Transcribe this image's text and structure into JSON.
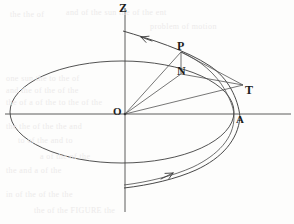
{
  "figure": {
    "background_color": "#fdfdfc",
    "ink_color": "#3a3a3a",
    "label_color": "#1d1d1d",
    "width": 294,
    "height": 224,
    "axes": [
      {
        "name": "z-axis",
        "label": "Z",
        "orientation": "vertical",
        "x": 125,
        "y_top": 8,
        "y_bottom": 212
      },
      {
        "name": "horizontal-axis",
        "label": "",
        "orientation": "horizontal",
        "y": 114,
        "x_left": 5,
        "x_right": 291
      }
    ],
    "labels": [
      {
        "id": "z",
        "text": "Z",
        "x": 119,
        "y": 2
      },
      {
        "id": "p",
        "text": "P",
        "x": 177,
        "y": 40
      },
      {
        "id": "n",
        "text": "N",
        "x": 177,
        "y": 65
      },
      {
        "id": "t",
        "text": "T",
        "x": 245,
        "y": 84
      },
      {
        "id": "a",
        "text": "A",
        "x": 236,
        "y": 114
      },
      {
        "id": "o",
        "text": "O",
        "x": 113,
        "y": 106
      }
    ],
    "points": {
      "O": {
        "x": 125,
        "y": 114
      },
      "P": {
        "x": 181,
        "y": 52
      },
      "N": {
        "x": 181,
        "y": 74
      },
      "T": {
        "x": 243,
        "y": 85
      },
      "A": {
        "x": 240,
        "y": 117
      }
    },
    "ellipse": {
      "name": "orbit-ellipse-projection",
      "center_x": 122,
      "center_y": 112,
      "radius_x": 112,
      "radius_y": 51
    },
    "arrows": [
      {
        "id": "upper-arrow",
        "x": 147,
        "y": 39,
        "direction": "left-up",
        "on": "upper-spiral-curve"
      },
      {
        "id": "lower-arrow",
        "x": 166,
        "y": 177,
        "direction": "right-up",
        "on": "lower-spiral-curve"
      }
    ],
    "segments": [
      {
        "id": "OP",
        "from": "O",
        "to": "P"
      },
      {
        "id": "ON",
        "from": "O",
        "to": "N"
      },
      {
        "id": "OT",
        "from": "O",
        "to": "T"
      },
      {
        "id": "PN",
        "from": "P",
        "to": "N"
      },
      {
        "id": "PT",
        "from": "P",
        "to": "T"
      },
      {
        "id": "NT",
        "from": "N",
        "to": "T"
      }
    ],
    "bleed_text": [
      {
        "text": "the the of",
        "x": 10,
        "y": 10
      },
      {
        "text": "and of the sun the of the ent",
        "x": 66,
        "y": 8
      },
      {
        "text": "problem of motion",
        "x": 150,
        "y": 22
      },
      {
        "text": "one sun the to the of",
        "x": 6,
        "y": 74
      },
      {
        "text": "and the of the of the",
        "x": 6,
        "y": 86
      },
      {
        "text": "the of a of the to the of the",
        "x": 6,
        "y": 98
      },
      {
        "text": "the the of the the and",
        "x": 6,
        "y": 122
      },
      {
        "text": "to of the and to",
        "x": 18,
        "y": 136
      },
      {
        "text": "a of the of the",
        "x": 40,
        "y": 152
      },
      {
        "text": "the and a of the",
        "x": 6,
        "y": 166
      },
      {
        "text": "in of the of the the",
        "x": 6,
        "y": 190
      },
      {
        "text": "the of the FIGURE the",
        "x": 34,
        "y": 206
      }
    ]
  }
}
